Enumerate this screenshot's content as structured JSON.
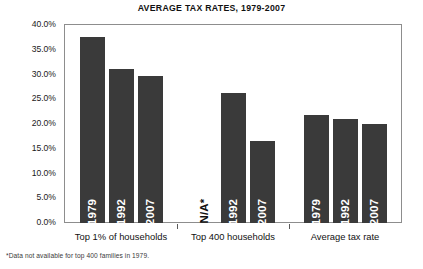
{
  "chart_data": {
    "type": "bar",
    "title": "AVERAGE TAX RATES, 1979-2007",
    "xlabel": "",
    "ylabel": "",
    "ylim": [
      0,
      40
    ],
    "ytick_step": 5,
    "ytick_labels": [
      "40.0%",
      "35.0%",
      "30.0%",
      "25.0%",
      "20.0%",
      "15.0%",
      "10.0%",
      "5.0%",
      "0.0%"
    ],
    "ytick_values": [
      40,
      35,
      30,
      25,
      20,
      15,
      10,
      5,
      0
    ],
    "grid": false,
    "legend": "none",
    "groups": [
      {
        "name": "Top 1% of households",
        "bars": [
          {
            "label": "1979",
            "value": 37.6,
            "available": true
          },
          {
            "label": "1992",
            "value": 31.2,
            "available": true
          },
          {
            "label": "2007",
            "value": 29.8,
            "available": true
          }
        ]
      },
      {
        "name": "Top 400 households",
        "bars": [
          {
            "label": "N/A*",
            "value": 0,
            "available": false
          },
          {
            "label": "1992",
            "value": 26.2,
            "available": true
          },
          {
            "label": "2007",
            "value": 16.5,
            "available": true
          }
        ]
      },
      {
        "name": "Average tax rate",
        "bars": [
          {
            "label": "1979",
            "value": 21.9,
            "available": true
          },
          {
            "label": "1992",
            "value": 21.1,
            "available": true
          },
          {
            "label": "2007",
            "value": 20.1,
            "available": true
          }
        ]
      }
    ],
    "categories": [
      "Top 1% of households",
      "Top 400 households",
      "Average tax rate"
    ],
    "series": [
      {
        "name": "1979",
        "values": [
          37.6,
          null,
          21.9
        ]
      },
      {
        "name": "1992",
        "values": [
          31.2,
          26.2,
          21.1
        ]
      },
      {
        "name": "2007",
        "values": [
          29.8,
          16.5,
          20.1
        ]
      }
    ],
    "bar_color": "#3a3a3a",
    "footnote": "*Data not available for top 400 families in 1979."
  }
}
